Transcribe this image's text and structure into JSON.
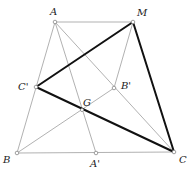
{
  "diagram": {
    "type": "geometry",
    "colors": {
      "thin_line": "#a8a8a8",
      "bold_line": "#111111",
      "point_stroke": "#888888",
      "label": "#222222"
    },
    "points": {
      "A": {
        "label": "A",
        "x": 55,
        "y": 22
      },
      "M": {
        "label": "M",
        "x": 133,
        "y": 22
      },
      "B": {
        "label": "B",
        "x": 17,
        "y": 153
      },
      "C": {
        "label": "C",
        "x": 174,
        "y": 152
      },
      "A'": {
        "label": "A'",
        "x": 96,
        "y": 153
      },
      "B'": {
        "label": "B'",
        "x": 114,
        "y": 88
      },
      "C'": {
        "label": "C'",
        "x": 36,
        "y": 87
      },
      "G": {
        "label": "G",
        "x": 82,
        "y": 110
      }
    },
    "thin_segments": [
      [
        "A",
        "M"
      ],
      [
        "A",
        "B"
      ],
      [
        "B",
        "C"
      ],
      [
        "A",
        "A'"
      ],
      [
        "A",
        "C"
      ],
      [
        "B",
        "B'"
      ],
      [
        "M",
        "B'"
      ],
      [
        "C'",
        "C"
      ]
    ],
    "bold_segments": [
      [
        "C'",
        "M"
      ],
      [
        "M",
        "C"
      ],
      [
        "C'",
        "C"
      ]
    ]
  }
}
